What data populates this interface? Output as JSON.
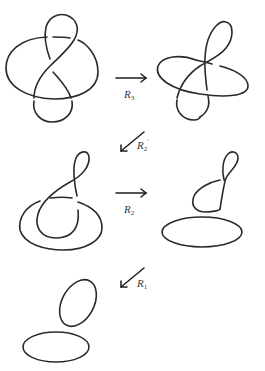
{
  "figure": {
    "diagrams": [
      {
        "id": "knot-1",
        "kind": "knot-diagram",
        "crossings": 4
      },
      {
        "id": "knot-2",
        "kind": "knot-diagram",
        "crossings": 4
      },
      {
        "id": "knot-3",
        "kind": "knot-diagram",
        "crossings": 3
      },
      {
        "id": "knot-4",
        "kind": "link-diagram",
        "crossings": 1
      },
      {
        "id": "knot-5",
        "kind": "unlink",
        "crossings": 0
      }
    ],
    "moves": [
      {
        "id": "move-r3",
        "symbol": "R",
        "subscript": "3",
        "direction": "right"
      },
      {
        "id": "move-r2-prime",
        "symbol": "R",
        "subscript": "2",
        "superscript": "'",
        "direction": "down-left"
      },
      {
        "id": "move-r2",
        "symbol": "R",
        "subscript": "2",
        "direction": "right"
      },
      {
        "id": "move-r1",
        "symbol": "R",
        "subscript": "1",
        "direction": "down-left"
      }
    ],
    "colors": {
      "stroke": "#2a2a2a",
      "background": "#ffffff"
    }
  }
}
